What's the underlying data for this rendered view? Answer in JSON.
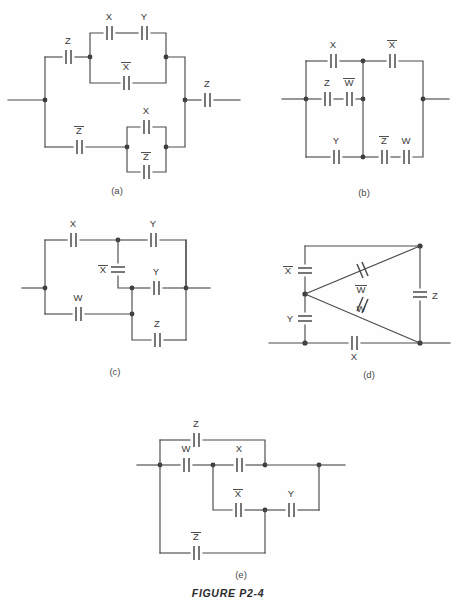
{
  "figure": {
    "caption": "FIGURE P2-4",
    "ink_color": "#4a4a4a",
    "background_color": "#fefefe"
  },
  "circuits": [
    {
      "id": "a",
      "sublabel": "(a)",
      "labels": [
        {
          "key": "a-z-left",
          "text": "Z",
          "bar": false
        },
        {
          "key": "a-x-top",
          "text": "X",
          "bar": false
        },
        {
          "key": "a-y-top",
          "text": "Y",
          "bar": false
        },
        {
          "key": "a-xbar",
          "text": "X",
          "bar": true
        },
        {
          "key": "a-z-right",
          "text": "Z",
          "bar": false
        },
        {
          "key": "a-zbar-bot",
          "text": "Z",
          "bar": true
        },
        {
          "key": "a-x-bot",
          "text": "X",
          "bar": false
        },
        {
          "key": "a-zbar-bot2",
          "text": "Z",
          "bar": true
        }
      ]
    },
    {
      "id": "b",
      "sublabel": "(b)",
      "labels": [
        {
          "key": "b-x",
          "text": "X",
          "bar": false
        },
        {
          "key": "b-xbar",
          "text": "X",
          "bar": true
        },
        {
          "key": "b-z",
          "text": "Z",
          "bar": false
        },
        {
          "key": "b-wbar",
          "text": "W",
          "bar": true
        },
        {
          "key": "b-y",
          "text": "Y",
          "bar": false
        },
        {
          "key": "b-zbar",
          "text": "Z",
          "bar": true
        },
        {
          "key": "b-w",
          "text": "W",
          "bar": false
        }
      ]
    },
    {
      "id": "c",
      "sublabel": "(c)",
      "labels": [
        {
          "key": "c-x",
          "text": "X",
          "bar": false
        },
        {
          "key": "c-y-top",
          "text": "Y",
          "bar": false
        },
        {
          "key": "c-xbar",
          "text": "X",
          "bar": true
        },
        {
          "key": "c-y-mid",
          "text": "Y",
          "bar": false
        },
        {
          "key": "c-w",
          "text": "W",
          "bar": false
        },
        {
          "key": "c-z",
          "text": "Z",
          "bar": false
        }
      ]
    },
    {
      "id": "d",
      "sublabel": "(d)",
      "labels": [
        {
          "key": "d-xbar",
          "text": "X",
          "bar": true
        },
        {
          "key": "d-wbar",
          "text": "W",
          "bar": true
        },
        {
          "key": "d-w",
          "text": "W",
          "bar": false
        },
        {
          "key": "d-z",
          "text": "Z",
          "bar": false
        },
        {
          "key": "d-y",
          "text": "Y",
          "bar": false
        },
        {
          "key": "d-x",
          "text": "X",
          "bar": false
        }
      ]
    },
    {
      "id": "e",
      "sublabel": "(e)",
      "labels": [
        {
          "key": "e-z",
          "text": "Z",
          "bar": false
        },
        {
          "key": "e-w",
          "text": "W",
          "bar": false
        },
        {
          "key": "e-x",
          "text": "X",
          "bar": false
        },
        {
          "key": "e-xbar",
          "text": "X",
          "bar": true
        },
        {
          "key": "e-y",
          "text": "Y",
          "bar": false
        },
        {
          "key": "e-zbar",
          "text": "Z",
          "bar": true
        }
      ]
    }
  ],
  "text": {
    "a-z-left": "Z",
    "a-x-top": "X",
    "a-y-top": "Y",
    "a-xbar": "X",
    "a-z-right": "Z",
    "a-zbar-bot": "Z",
    "a-x-bot": "X",
    "a-zbar-bot2": "Z",
    "a-sub": "(a)",
    "b-x": "X",
    "b-xbar": "X",
    "b-z": "Z",
    "b-wbar": "W",
    "b-y": "Y",
    "b-zbar": "Z",
    "b-w": "W",
    "b-sub": "(b)",
    "c-x": "X",
    "c-y-top": "Y",
    "c-xbar": "X",
    "c-y-mid": "Y",
    "c-w": "W",
    "c-z": "Z",
    "c-sub": "(c)",
    "d-xbar": "X",
    "d-wbar": "W",
    "d-w": "W",
    "d-z": "Z",
    "d-y": "Y",
    "d-x": "X",
    "d-sub": "(d)",
    "e-z": "Z",
    "e-w": "W",
    "e-x": "X",
    "e-xbar": "X",
    "e-y": "Y",
    "e-zbar": "Z",
    "e-sub": "(e)",
    "caption": "FIGURE P2-4"
  }
}
